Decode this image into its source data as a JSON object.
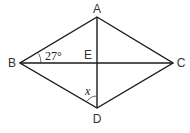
{
  "diagram": {
    "type": "rhombus-with-diagonals",
    "vertices": {
      "A": {
        "label": "A",
        "x": 97,
        "y": 17
      },
      "B": {
        "label": "B",
        "x": 20,
        "y": 63
      },
      "C": {
        "label": "C",
        "x": 173,
        "y": 63
      },
      "D": {
        "label": "D",
        "x": 97,
        "y": 108
      },
      "E": {
        "label": "E",
        "x": 97,
        "y": 63
      }
    },
    "labels": {
      "A": "A",
      "B": "B",
      "C": "C",
      "D": "D",
      "E": "E"
    },
    "angles": {
      "ABE": "27°",
      "EDB": "x"
    },
    "stroke_color": "#1a1a1a"
  }
}
